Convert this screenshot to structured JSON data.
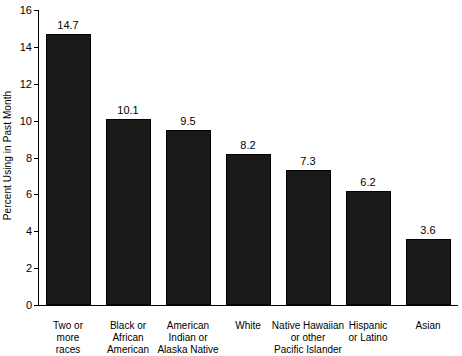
{
  "chart_data": {
    "type": "bar",
    "title": "",
    "xlabel": "",
    "ylabel": "Percent Using in Past Month",
    "ylim": [
      0,
      16
    ],
    "yticks": [
      0,
      2,
      4,
      6,
      8,
      10,
      12,
      14,
      16
    ],
    "ytick_labels": [
      "0",
      "2",
      "4",
      "6",
      "8",
      "10",
      "12",
      "14",
      "16"
    ],
    "grid": false,
    "legend": "none",
    "categories": [
      "Two or\nmore\nraces",
      "Black or\nAfrican\nAmerican",
      "American\nIndian or\nAlaska Native",
      "White",
      "Native Hawaiian\nor other\nPacific Islander",
      "Hispanic\nor Latino",
      "Asian"
    ],
    "values": [
      14.7,
      10.1,
      9.5,
      8.2,
      7.3,
      6.2,
      3.6
    ],
    "value_labels": [
      "14.7",
      "10.1",
      "9.5",
      "8.2",
      "7.3",
      "6.2",
      "3.6"
    ],
    "bar_color": "#1a1a1a",
    "bar_edge_color": "#000000",
    "axis_color": "#000000",
    "background_color": "#ffffff"
  }
}
